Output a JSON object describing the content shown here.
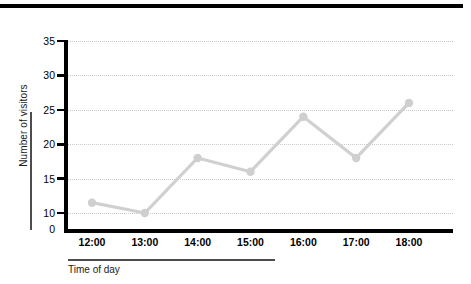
{
  "chart_data": {
    "type": "line",
    "title": "",
    "xlabel": "Time of day",
    "ylabel": "Number of visitors",
    "categories": [
      "12:00",
      "13:00",
      "14:00",
      "15:00",
      "16:00",
      "17:00",
      "18:00"
    ],
    "values": [
      11.5,
      10,
      18,
      16,
      24,
      18,
      26
    ],
    "series": [
      {
        "name": "Number of visitors",
        "values": [
          11.5,
          10,
          18,
          16,
          24,
          18,
          26
        ]
      }
    ],
    "ylim": [
      0,
      35
    ],
    "yticks": [
      0,
      10,
      15,
      20,
      25,
      30,
      35
    ],
    "ytick_labels": [
      "0",
      "10",
      "15",
      "20",
      "25",
      "30",
      "35"
    ],
    "xtick_labels": [
      "12:00",
      "13:00",
      "14:00",
      "15:00",
      "16:00",
      "17:00",
      "18:00"
    ],
    "grid": "horizontal-dotted",
    "legend": "none",
    "line_color": "#d0d0d0",
    "marker_color": "#cfcfcf",
    "axis_color": "#000000",
    "grid_color": "#c9c9c9",
    "marker": "circle"
  },
  "colors": {
    "line": "#d0d0d0",
    "marker": "#cfcfcf",
    "axis": "#000000",
    "grid": "#c9c9c9",
    "rule": "#4d4d4d",
    "text": "#000000",
    "background": "#ffffff"
  }
}
